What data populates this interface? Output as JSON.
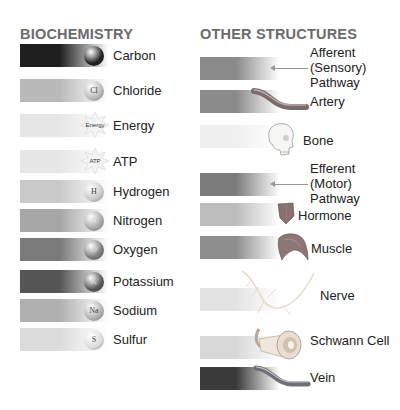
{
  "headings": {
    "left": "BIOCHEMISTRY",
    "right": "OTHER STRUCTURES"
  },
  "biochemistry": [
    {
      "label": "Carbon",
      "symbol": "",
      "icon": "carbon-ball-icon",
      "color": "#1e1e1e"
    },
    {
      "label": "Chloride",
      "symbol": "Cl",
      "icon": "chloride-ball-icon",
      "color": "#b9b9b9"
    },
    {
      "label": "Energy",
      "symbol": "Energy",
      "icon": "energy-starburst-icon",
      "color": "#e6e6e6"
    },
    {
      "label": "ATP",
      "symbol": "ATP",
      "icon": "atp-starburst-icon",
      "color": "#e6e6e6"
    },
    {
      "label": "Hydrogen",
      "symbol": "H",
      "icon": "hydrogen-ball-icon",
      "color": "#c9c9c9"
    },
    {
      "label": "Nitrogen",
      "symbol": "N",
      "icon": "nitrogen-ball-icon",
      "color": "#a6a6a6"
    },
    {
      "label": "Oxygen",
      "symbol": "O",
      "icon": "oxygen-ball-icon",
      "color": "#7a7a7a"
    },
    {
      "label": "Potassium",
      "symbol": "K",
      "icon": "potassium-ball-icon",
      "color": "#555555"
    },
    {
      "label": "Sodium",
      "symbol": "Na",
      "icon": "sodium-ball-icon",
      "color": "#b0b0b0"
    },
    {
      "label": "Sulfur",
      "symbol": "S",
      "icon": "sulfur-ball-icon",
      "color": "#dcdcdc"
    }
  ],
  "other_structures": [
    {
      "label": "Afferent (Sensory) Pathway",
      "lines": [
        "Afferent",
        "(Sensory)",
        "Pathway"
      ],
      "icon": "arrow-left-icon",
      "color": "#8a8a8a"
    },
    {
      "label": "Artery",
      "lines": [
        "Artery"
      ],
      "icon": "artery-tube-icon",
      "color": "#8a8a8a"
    },
    {
      "label": "Bone",
      "lines": [
        "Bone"
      ],
      "icon": "skull-icon",
      "color": "#f0f0f0"
    },
    {
      "label": "Efferent (Motor) Pathway",
      "lines": [
        "Efferent",
        "(Motor)",
        "Pathway"
      ],
      "icon": "arrow-left-icon",
      "color": "#7c7c7c"
    },
    {
      "label": "Hormone",
      "lines": [
        "Hormone"
      ],
      "icon": "hormone-gland-icon",
      "color": "#bdbdbd"
    },
    {
      "label": "Muscle",
      "lines": [
        "Muscle"
      ],
      "icon": "muscle-icon",
      "color": "#8e8e8e"
    },
    {
      "label": "Nerve",
      "lines": [
        "Nerve"
      ],
      "icon": "nerve-icon",
      "color": "#e3e3e3"
    },
    {
      "label": "Schwann Cell",
      "lines": [
        "Schwann Cell"
      ],
      "icon": "schwann-cell-icon",
      "color": "#d8d8d8"
    },
    {
      "label": "Vein",
      "lines": [
        "Vein"
      ],
      "icon": "vein-tube-icon",
      "color": "#3a3a3a"
    }
  ]
}
